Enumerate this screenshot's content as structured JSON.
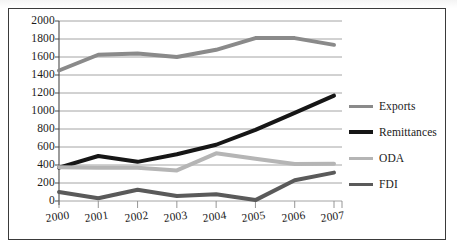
{
  "chart_data": {
    "type": "line",
    "title": "",
    "subtitle": "",
    "xlabel": "",
    "ylabel": "",
    "categories": [
      "2000",
      "2001",
      "2002",
      "2003",
      "2004",
      "2005",
      "2006",
      "2007"
    ],
    "x_tick_labels": [
      "2000",
      "2001",
      "2002",
      "2003",
      "2004",
      "2005",
      "2006",
      "2007"
    ],
    "y_tick_labels": [
      "0",
      "200",
      "400",
      "600",
      "800",
      "1000",
      "1200",
      "1400",
      "1600",
      "1800",
      "2000"
    ],
    "y_ticks": [
      0,
      200,
      400,
      600,
      800,
      1000,
      1200,
      1400,
      1600,
      1800,
      2000
    ],
    "ylim": [
      0,
      2000
    ],
    "grid": "horizontal",
    "legend_position": "right",
    "series": [
      {
        "name": "Exports",
        "color": "#8a8a8a",
        "width": 4.0,
        "values": [
          1450,
          1625,
          1640,
          1600,
          1680,
          1810,
          1810,
          1735
        ]
      },
      {
        "name": "Remittances",
        "color": "#161616",
        "width": 4.0,
        "values": [
          370,
          500,
          435,
          520,
          625,
          790,
          980,
          1170
        ]
      },
      {
        "name": "ODA",
        "color": "#b5b5b5",
        "width": 4.0,
        "values": [
          375,
          370,
          370,
          340,
          530,
          470,
          410,
          415
        ]
      },
      {
        "name": "FDI",
        "color": "#5a5a5a",
        "width": 4.0,
        "values": [
          100,
          30,
          125,
          55,
          75,
          10,
          230,
          315
        ]
      }
    ]
  },
  "legend": {
    "items": [
      {
        "label": "Exports",
        "color": "#8a8a8a"
      },
      {
        "label": "Remittances",
        "color": "#161616"
      },
      {
        "label": "ODA",
        "color": "#b5b5b5"
      },
      {
        "label": "FDI",
        "color": "#5a5a5a"
      }
    ]
  }
}
